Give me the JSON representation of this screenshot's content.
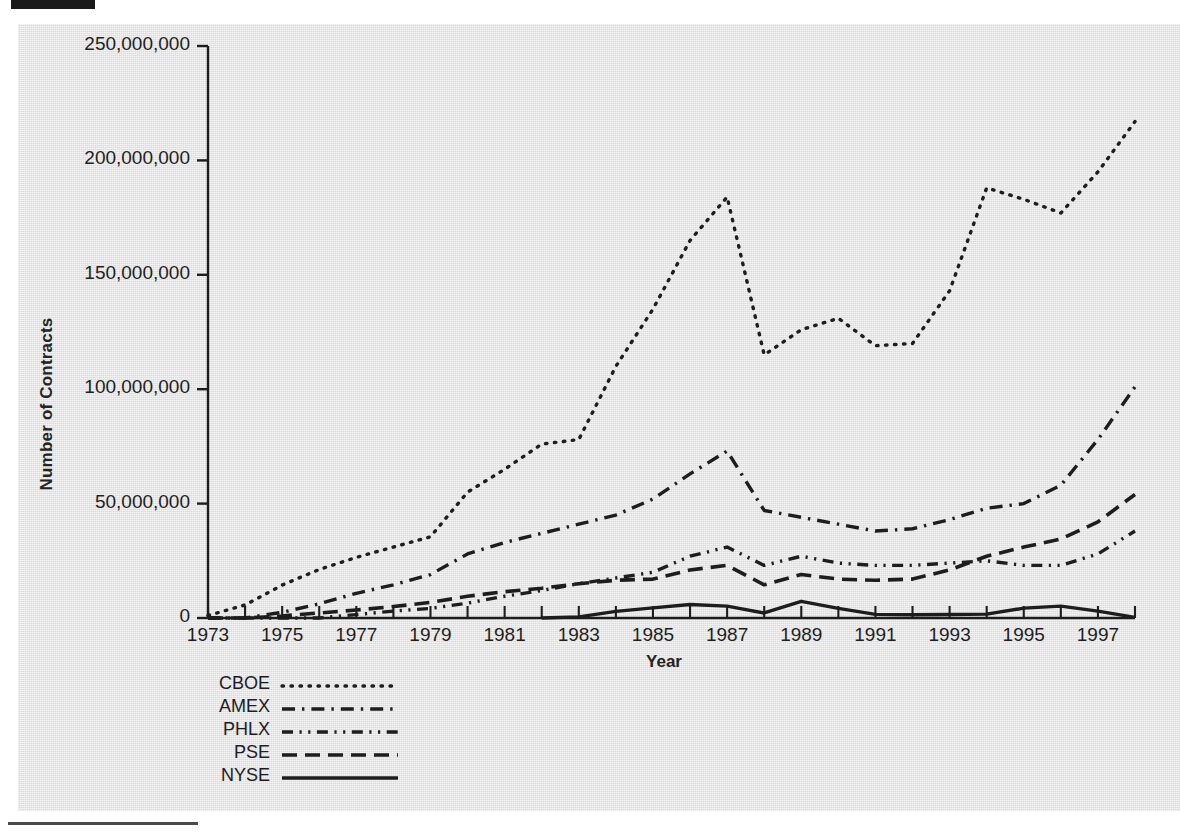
{
  "figure": {
    "y_axis_title": "Number of Contracts",
    "x_axis_title": "Year"
  },
  "legend": {
    "items": [
      {
        "label": "CBOE",
        "style": "dotted"
      },
      {
        "label": "AMEX",
        "style": "dash-dot"
      },
      {
        "label": "PHLX",
        "style": "dash-dot-dot"
      },
      {
        "label": "PSE",
        "style": "dashed"
      },
      {
        "label": "NYSE",
        "style": "solid"
      }
    ]
  },
  "chart_data": {
    "type": "line",
    "title": "",
    "xlabel": "Year",
    "ylabel": "Number of Contracts",
    "xlim": [
      1973,
      1998
    ],
    "ylim": [
      0,
      250000000
    ],
    "grid": false,
    "legend_position": "below-left",
    "x": [
      1973,
      1974,
      1975,
      1976,
      1977,
      1978,
      1979,
      1980,
      1981,
      1982,
      1983,
      1984,
      1985,
      1986,
      1987,
      1988,
      1989,
      1990,
      1991,
      1992,
      1993,
      1994,
      1995,
      1996,
      1997,
      1998
    ],
    "xticks": [
      1973,
      1975,
      1977,
      1979,
      1981,
      1983,
      1985,
      1987,
      1989,
      1991,
      1993,
      1995,
      1997
    ],
    "xtick_labels": [
      "1973",
      "1975",
      "1977",
      "1979",
      "1981",
      "1983",
      "1985",
      "1987",
      "1989",
      "1991",
      "1993",
      "1995",
      "1997"
    ],
    "yticks": [
      0,
      50000000,
      100000000,
      150000000,
      200000000,
      250000000
    ],
    "ytick_labels": [
      "0",
      "50,000,000",
      "100,000,000",
      "150,000,000",
      "200,000,000",
      "250,000,000"
    ],
    "series": [
      {
        "name": "CBOE",
        "style": "dotted",
        "values": [
          1100000,
          5700000,
          14400000,
          21200000,
          26500000,
          31000000,
          35500000,
          55000000,
          65000000,
          76000000,
          78000000,
          110000000,
          135000000,
          165000000,
          184000000,
          115000000,
          126000000,
          131000000,
          119000000,
          120000000,
          143000000,
          188000000,
          183000000,
          177000000,
          195000000,
          217000000
        ]
      },
      {
        "name": "AMEX",
        "style": "dash-dot",
        "values": [
          0,
          0,
          2500000,
          6200000,
          10800000,
          14500000,
          19000000,
          28000000,
          33000000,
          37000000,
          41000000,
          45000000,
          52000000,
          63000000,
          73000000,
          47000000,
          44000000,
          41000000,
          38000000,
          39000000,
          43000000,
          48000000,
          50000000,
          58000000,
          78000000,
          101000000
        ]
      },
      {
        "name": "PHLX",
        "style": "dash-dot-dot",
        "values": [
          0,
          0,
          0,
          0,
          1500000,
          3000000,
          4200000,
          6500000,
          9500000,
          12000000,
          15000000,
          17500000,
          20000000,
          27000000,
          31000000,
          23000000,
          27000000,
          24000000,
          23000000,
          23000000,
          24000000,
          25000000,
          23000000,
          23000000,
          28000000,
          38000000
        ]
      },
      {
        "name": "PSE",
        "style": "dashed",
        "values": [
          0,
          0,
          900000,
          2200000,
          3500000,
          5000000,
          6800000,
          9500000,
          11500000,
          13000000,
          15000000,
          16500000,
          17000000,
          21000000,
          23000000,
          14500000,
          19000000,
          17000000,
          16500000,
          17000000,
          21000000,
          27000000,
          31000000,
          34500000,
          42000000,
          54000000
        ]
      },
      {
        "name": "NYSE",
        "style": "solid",
        "values": [
          0,
          0,
          0,
          0,
          0,
          0,
          0,
          0,
          0,
          0,
          500000,
          2900000,
          4400000,
          5900000,
          5200000,
          2200000,
          7300000,
          4200000,
          1600000,
          1400000,
          1500000,
          1700000,
          4300000,
          5200000,
          3000000,
          300000
        ]
      }
    ]
  }
}
